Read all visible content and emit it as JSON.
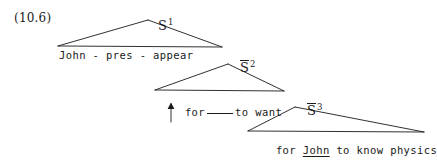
{
  "figure": {
    "example_number": "(10.6)",
    "type": "syntactic-tree",
    "notation": "S-bar / triangle abbreviation with movement arrow"
  },
  "nodes": {
    "s1": {
      "symbol": "S",
      "superscript": "1",
      "barred": false,
      "label": "S1"
    },
    "s2": {
      "symbol": "S",
      "superscript": "2",
      "barred": true,
      "label": "S-bar 2"
    },
    "s3": {
      "symbol": "S",
      "superscript": "3",
      "barred": true,
      "label": "S-bar 3"
    }
  },
  "terminals": {
    "level1": {
      "text": "John - pres - appear",
      "parts": [
        "John",
        "-",
        "pres",
        "-",
        "appear"
      ]
    },
    "level2": {
      "before_gap": "for",
      "gap": "",
      "after_gap": "to want"
    },
    "level3": {
      "prefix": "for ",
      "underlined": "John",
      "suffix": " to know physics",
      "full_text": "for John to know physics"
    }
  },
  "movement": {
    "arrow_name": "movement-arrow",
    "direction": "up",
    "description": "arrow pointing up into the gap"
  },
  "colors": {
    "ink": "#1a1a1a",
    "background": "#ffffff"
  }
}
